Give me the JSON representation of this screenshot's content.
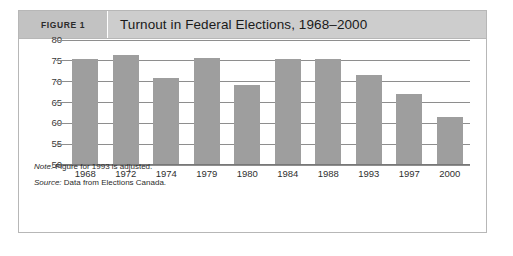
{
  "figure": {
    "label": "FIGURE 1",
    "title": "Turnout in Federal Elections, 1968–2000",
    "note": {
      "lead": "Note:",
      "text": " Figure for 1993 is adjusted."
    },
    "source": {
      "lead": "Source:",
      "text": " Data from Elections Canada."
    }
  },
  "colors": {
    "bar": "#9e9e9e",
    "gridline": "#8e8e8e",
    "header_band": "#cdcdcd",
    "header_label_band": "#c2c2c2",
    "box_border": "#b7b7b7"
  },
  "chart_data": {
    "type": "bar",
    "title": "Turnout in Federal Elections, 1968–2000",
    "xlabel": "",
    "ylabel": "",
    "categories": [
      "1968",
      "1972",
      "1974",
      "1979",
      "1980",
      "1984",
      "1988",
      "1993",
      "1997",
      "2000"
    ],
    "values": [
      75.5,
      76.5,
      71.0,
      75.8,
      69.3,
      75.5,
      75.5,
      71.5,
      67.0,
      61.5
    ],
    "ylim": [
      50,
      80
    ],
    "yticks": [
      50,
      55,
      60,
      65,
      70,
      75,
      80
    ],
    "ytick_labels": [
      "50",
      "55",
      "60",
      "65",
      "70",
      "75",
      "80"
    ],
    "grid": true,
    "legend": false,
    "annotations": [
      "Note: Figure for 1993 is adjusted.",
      "Source: Data from Elections Canada."
    ]
  }
}
